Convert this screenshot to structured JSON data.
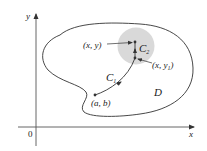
{
  "diagram": {
    "axes": {
      "x_label": "x",
      "y_label": "y",
      "origin_label": "0"
    },
    "region_label": "D",
    "curves": {
      "c1": {
        "label": "C",
        "subscript": "1"
      },
      "c2": {
        "label": "C",
        "subscript": "2"
      }
    },
    "points": {
      "start": {
        "label": "(a, b)"
      },
      "end": {
        "label": "(x, y)"
      },
      "mid": {
        "label_main": "(x, y",
        "label_sub": "1",
        "label_close": ")"
      }
    },
    "colors": {
      "stroke": "#333333",
      "disk_fill": "#d9d9d9",
      "background": "#ffffff"
    }
  }
}
